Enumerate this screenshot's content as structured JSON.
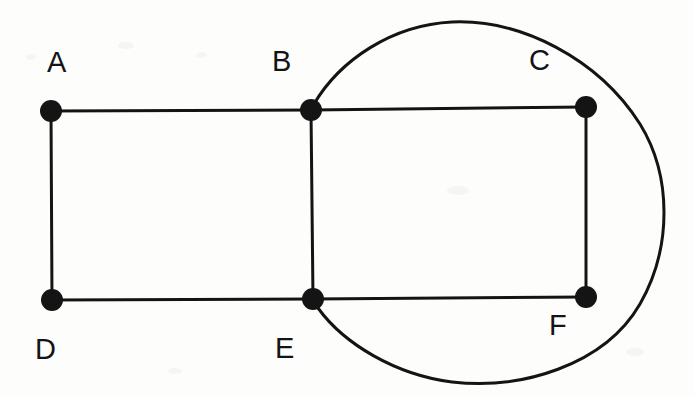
{
  "diagram": {
    "type": "graph-drawing",
    "background_color": "#fdfdfc",
    "stroke_color": "#141414",
    "vertex_fill_color": "#141414",
    "canvas": {
      "width": 694,
      "height": 395
    },
    "vertices": [
      {
        "id": "A",
        "label": "A",
        "cx": 51,
        "cy": 111,
        "r": 11,
        "label_x": 47,
        "label_y": 48
      },
      {
        "id": "B",
        "label": "B",
        "cx": 311,
        "cy": 110,
        "r": 11,
        "label_x": 272,
        "label_y": 47
      },
      {
        "id": "C",
        "label": "C",
        "cx": 586,
        "cy": 107,
        "r": 11,
        "label_x": 529,
        "label_y": 46
      },
      {
        "id": "D",
        "label": "D",
        "cx": 52,
        "cy": 300,
        "r": 11,
        "label_x": 35,
        "label_y": 335
      },
      {
        "id": "E",
        "label": "E",
        "cx": 313,
        "cy": 299,
        "r": 11,
        "label_x": 275,
        "label_y": 334
      },
      {
        "id": "F",
        "label": "F",
        "cx": 586,
        "cy": 297,
        "r": 11,
        "label_x": 549,
        "label_y": 311
      }
    ],
    "straight_edges": [
      {
        "id": "edge-A-B",
        "from": "A",
        "to": "B"
      },
      {
        "id": "edge-B-C",
        "from": "B",
        "to": "C"
      },
      {
        "id": "edge-A-D",
        "from": "A",
        "to": "D"
      },
      {
        "id": "edge-B-E",
        "from": "B",
        "to": "E"
      },
      {
        "id": "edge-C-F",
        "from": "C",
        "to": "F"
      },
      {
        "id": "edge-D-E",
        "from": "D",
        "to": "E"
      },
      {
        "id": "edge-E-F",
        "from": "E",
        "to": "F"
      }
    ],
    "curved_edges": [
      {
        "id": "edge-B-E-curved",
        "from": "B",
        "to": "E",
        "shape": "long outer arc passing above C, around the right side, and below F",
        "path": "M 314 104 C 340 60, 392 25, 452 22 C 520 19, 598 58, 640 124 C 672 176, 672 248, 640 304 C 604 366, 520 390, 452 382 C 396 375, 344 344, 318 308"
      }
    ],
    "edge_count": 8,
    "vertex_count": 6
  }
}
